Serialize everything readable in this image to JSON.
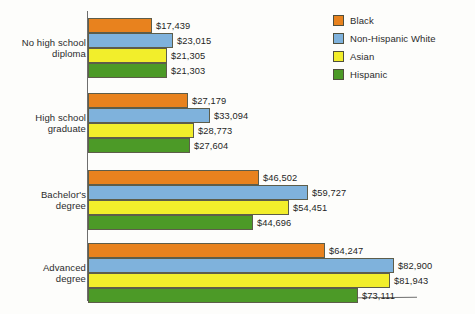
{
  "chart_data": {
    "type": "bar",
    "orientation": "horizontal",
    "title": "",
    "subtitle": "",
    "xlabel": "",
    "ylabel": "",
    "grid": false,
    "legend_position": "top-right",
    "xlim": [
      0,
      90000
    ],
    "value_prefix": "$",
    "categories": [
      "No high school diploma",
      "High school graduate",
      "Bachelor's degree",
      "Advanced degree"
    ],
    "category_lines": [
      [
        "No high school",
        "diploma"
      ],
      [
        "High school",
        "graduate"
      ],
      [
        "Bachelor's",
        "degree"
      ],
      [
        "Advanced",
        "degree"
      ]
    ],
    "series": [
      {
        "name": "Black",
        "color": "#E8821E",
        "values": [
          17439,
          27179,
          46502,
          64247
        ],
        "labels": [
          "$17,439",
          "$27,179",
          "$46,502",
          "$64,247"
        ]
      },
      {
        "name": "Non-Hispanic White",
        "color": "#7FB2DC",
        "values": [
          23015,
          33094,
          59727,
          82900
        ],
        "labels": [
          "$23,015",
          "$33,094",
          "$59,727",
          "$82,900"
        ]
      },
      {
        "name": "Asian",
        "color": "#F2EE2B",
        "values": [
          21305,
          28773,
          54451,
          81943
        ],
        "labels": [
          "$21,305",
          "$28,773",
          "$54,451",
          "$81,943"
        ]
      },
      {
        "name": "Hispanic",
        "color": "#4C9A27",
        "values": [
          21303,
          27604,
          44696,
          73111
        ],
        "labels": [
          "$21,303",
          "$27,604",
          "$44,696",
          "$73,111"
        ]
      }
    ]
  },
  "legend": {
    "items": [
      {
        "label": "Black",
        "color": "#E8821E"
      },
      {
        "label": "Non-Hispanic White",
        "color": "#7FB2DC"
      },
      {
        "label": "Asian",
        "color": "#F2EE2B"
      },
      {
        "label": "Hispanic",
        "color": "#4C9A27"
      }
    ]
  }
}
